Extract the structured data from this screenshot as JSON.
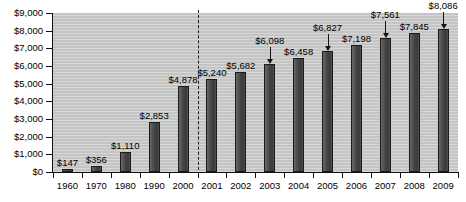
{
  "chart_data": {
    "type": "bar",
    "title": "",
    "subtitle": "",
    "xlabel": "",
    "ylabel": "",
    "ylim": [
      0,
      9000
    ],
    "grid": false,
    "legend": null,
    "y_ticks": [
      "$0",
      "$1,000",
      "$2,000",
      "$3,000",
      "$4,000",
      "$5,000",
      "$6,000",
      "$7,000",
      "$8,000",
      "$9,000"
    ],
    "y_tick_values": [
      0,
      1000,
      2000,
      3000,
      4000,
      5000,
      6000,
      7000,
      8000,
      9000
    ],
    "categories": [
      "1960",
      "1970",
      "1980",
      "1990",
      "2000",
      "2001",
      "2002",
      "2003",
      "2004",
      "2005",
      "2006",
      "2007",
      "2008",
      "2009"
    ],
    "values": [
      147,
      356,
      1110,
      2853,
      4878,
      5240,
      5682,
      6098,
      6458,
      6827,
      7198,
      7561,
      7845,
      8086
    ],
    "data_labels": [
      "$147",
      "$356",
      "$1,110",
      "$2,853",
      "$4,878",
      "$5,240",
      "$5,682",
      "$6,098",
      "$6,458",
      "$6,827",
      "$7,198",
      "$7,561",
      "$7,845",
      "$8,086"
    ],
    "annotations": [
      {
        "label": "$6,098",
        "points_to": "2003",
        "type": "arrow"
      },
      {
        "label": "$6,827",
        "points_to": "2005",
        "type": "arrow"
      },
      {
        "label": "$7,561",
        "points_to": "2007",
        "type": "arrow"
      },
      {
        "label": "$8,086",
        "points_to": "2009",
        "type": "arrow"
      }
    ],
    "divider": {
      "type": "dashed-vertical",
      "between": [
        "2000",
        "2001"
      ]
    },
    "colors": {
      "bar": "#4a4a4a",
      "bar_border": "#1b1b1b",
      "plot_background": "#c9c9c9",
      "axis": "#101010",
      "text": "#000000"
    }
  },
  "bars": [
    {
      "label": "1960",
      "value_text": "$147"
    },
    {
      "label": "1970",
      "value_text": "$356"
    },
    {
      "label": "1980",
      "value_text": "$1,110"
    },
    {
      "label": "1990",
      "value_text": "$2,853"
    },
    {
      "label": "2000",
      "value_text": "$4,878"
    },
    {
      "label": "2001",
      "value_text": "$5,240"
    },
    {
      "label": "2002",
      "value_text": "$5,682"
    },
    {
      "label": "2003",
      "value_text": "$6,098"
    },
    {
      "label": "2004",
      "value_text": "$6,458"
    },
    {
      "label": "2005",
      "value_text": "$6,827"
    },
    {
      "label": "2006",
      "value_text": "$7,198"
    },
    {
      "label": "2007",
      "value_text": "$7,561"
    },
    {
      "label": "2008",
      "value_text": "$7,845"
    },
    {
      "label": "2009",
      "value_text": "$8,086"
    }
  ]
}
